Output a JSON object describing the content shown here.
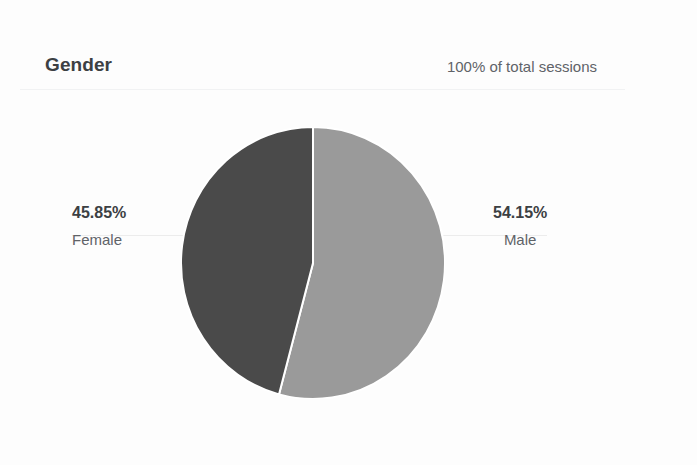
{
  "card": {
    "title": "Gender",
    "subtitle": "100% of total sessions"
  },
  "chart_data": {
    "type": "pie",
    "title": "Gender",
    "subtitle": "100% of total sessions",
    "unit": "percent",
    "metric": "sessions",
    "start_angle_deg": 0,
    "direction": "clockwise",
    "legend": "none",
    "labels_position": "outside-with-leader-lines",
    "categories": [
      "Male",
      "Female"
    ],
    "values": [
      54.15,
      45.85
    ],
    "slices": [
      {
        "name": "Male",
        "value": 54.15,
        "value_label": "54.15%",
        "color": "#9a9a9a",
        "sweep_deg": 194.94,
        "start_deg": 0
      },
      {
        "name": "Female",
        "value": 45.85,
        "value_label": "45.85%",
        "color": "#4a4a4a",
        "sweep_deg": 165.06,
        "start_deg": 194.94
      }
    ]
  },
  "colors": {
    "background": "#fdfdfd",
    "title_text": "#3c4043",
    "secondary_text": "#5f6368",
    "rule": "#f1f2f3",
    "leader_line": "#ececec",
    "slice_male": "#9a9a9a",
    "slice_female": "#4a4a4a",
    "slice_gap": "#ffffff"
  }
}
